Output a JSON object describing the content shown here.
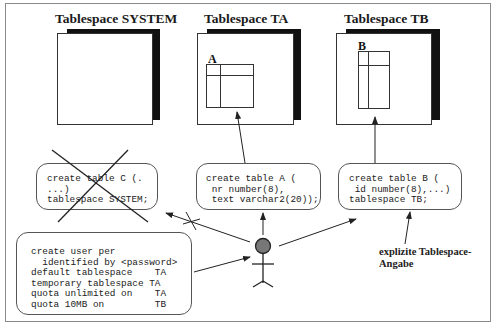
{
  "diagram": {
    "tablespaces": [
      {
        "id": "system",
        "title": "Tablespace SYSTEM",
        "table_label": ""
      },
      {
        "id": "ta",
        "title": "Tablespace TA",
        "table_label": "A"
      },
      {
        "id": "tb",
        "title": "Tablespace TB",
        "table_label": "B"
      }
    ],
    "statements": {
      "table_c": "create table C (.\n...)\ntablespace SYSTEM;",
      "table_a": "create table A (\n nr number(8),\n text varchar2(20));",
      "table_b": "create table B (\n id number(8),...)\ntablespace TB;",
      "create_user": "create user per\n  identified by <password>\ndefault tablespace    TA\ntemporary tablespace TA\nquota unlimited on    TA\nquota 10MB on         TB"
    },
    "annotation": "explizite Tablespace-\nAngabe",
    "actor": "user",
    "crossed_out": [
      "table_c"
    ],
    "colors": {
      "line": "#333333",
      "shadow": "#111111",
      "actor_head": "#777777"
    }
  }
}
